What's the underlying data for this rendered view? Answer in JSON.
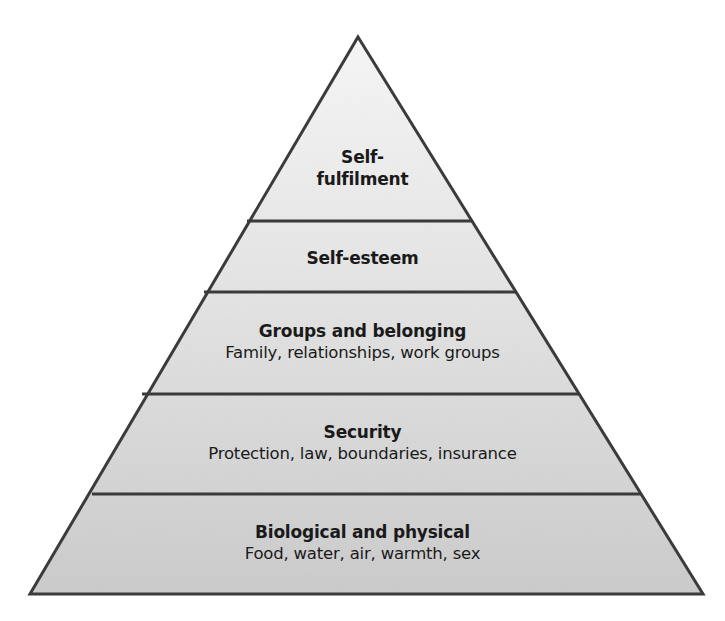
{
  "diagram": {
    "type": "pyramid",
    "colors": {
      "outline": "#3a3a3a",
      "fill_top": "#f4f4f4",
      "fill_bottom": "#cdcdcd",
      "text": "#1a1a1a"
    },
    "tiers": [
      {
        "level": 5,
        "title_line1": "Self-",
        "title_line2": "fulfilment",
        "subtitle": ""
      },
      {
        "level": 4,
        "title": "Self-esteem",
        "subtitle": ""
      },
      {
        "level": 3,
        "title": "Groups and belonging",
        "subtitle": "Family, relationships, work groups"
      },
      {
        "level": 2,
        "title": "Security",
        "subtitle": "Protection, law, boundaries, insurance"
      },
      {
        "level": 1,
        "title": "Biological and physical",
        "subtitle": "Food, water, air, warmth, sex"
      }
    ]
  }
}
